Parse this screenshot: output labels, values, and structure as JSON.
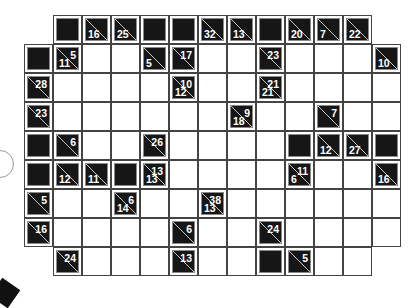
{
  "puzzle": {
    "type": "kakuro",
    "cell_size": 29,
    "origin": {
      "x": 24,
      "y": 15
    },
    "cols": 13,
    "rows": 9,
    "legend": {
      "W": "empty white entry cell",
      "B": "solid black block",
      "N": "no cell",
      "clue": "black clue cell with diagonal; 'd' = down sum (lower-left), 'r' = across sum (upper-right)"
    },
    "grid": [
      [
        "N",
        "B",
        {
          "d": "16"
        },
        {
          "d": "25"
        },
        "B",
        "B",
        {
          "d": "32"
        },
        {
          "d": "13"
        },
        "B",
        {
          "d": "20"
        },
        {
          "d": "7"
        },
        {
          "d": "22"
        },
        "N"
      ],
      [
        "B",
        {
          "r": "5",
          "d": "11"
        },
        "W",
        "W",
        {
          "d": "5"
        },
        {
          "r": "17"
        },
        "W",
        "W",
        {
          "r": "23"
        },
        "W",
        "W",
        "W",
        {
          "d": "10"
        }
      ],
      [
        {
          "r": "28"
        },
        "W",
        "W",
        "W",
        "W",
        {
          "r": "10",
          "d": "12"
        },
        "W",
        "W",
        {
          "r": "21",
          "d": "21"
        },
        "W",
        "W",
        "W",
        "W"
      ],
      [
        {
          "r": "23"
        },
        "W",
        "W",
        "W",
        "W",
        "W",
        "W",
        {
          "r": "9",
          "d": "18"
        },
        "W",
        "W",
        {
          "r": "7"
        },
        "W",
        "W"
      ],
      [
        "B",
        {
          "r": "6"
        },
        "W",
        "W",
        {
          "r": "26"
        },
        "W",
        "W",
        "W",
        "W",
        "B",
        {
          "d": "12"
        },
        {
          "d": "27"
        },
        "B"
      ],
      [
        "B",
        {
          "d": "12"
        },
        {
          "d": "11"
        },
        "B",
        {
          "r": "13",
          "d": "13"
        },
        "W",
        "W",
        "W",
        "W",
        {
          "r": "11",
          "d": "6"
        },
        "W",
        "W",
        {
          "d": "16"
        }
      ],
      [
        {
          "r": "5"
        },
        "W",
        "W",
        {
          "r": "6",
          "d": "14"
        },
        "W",
        "W",
        {
          "r": "38",
          "d": "13"
        },
        "W",
        "W",
        "W",
        "W",
        "W",
        "W"
      ],
      [
        {
          "r": "16"
        },
        "W",
        "W",
        "W",
        "W",
        {
          "r": "6"
        },
        "W",
        "W",
        {
          "r": "24"
        },
        "W",
        "W",
        "W",
        "W"
      ],
      [
        "N",
        {
          "r": "24"
        },
        "W",
        "W",
        "W",
        {
          "r": "13"
        },
        "W",
        "W",
        "B",
        {
          "r": "5"
        },
        "W",
        "W",
        "N"
      ]
    ]
  },
  "colors": {
    "clue_fill": "#161616",
    "clue_border": "#8a8a8a",
    "grid_line": "#444444",
    "entry_fill": "#ffffff",
    "number_color": "#ffffff"
  }
}
